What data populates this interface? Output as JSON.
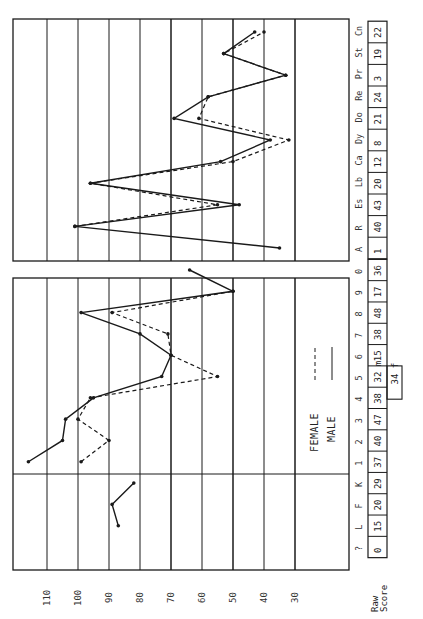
{
  "chart_data": {
    "type": "line",
    "title": "",
    "orientation": "rotated 90deg counter-clockwise (T-score axis horizontal, scales listed vertically)",
    "xlabel": "T-score",
    "ylabel": "Scale",
    "tscore_ticks": [
      110,
      100,
      90,
      80,
      70,
      60,
      50,
      40,
      30
    ],
    "tscore_range": [
      121,
      13
    ],
    "grid": true,
    "raw_score_label": [
      "Raw",
      "Score"
    ],
    "legend": [
      {
        "name": "Female",
        "style": "dashed"
      },
      {
        "name": "Male",
        "style": "solid"
      }
    ],
    "panels": [
      {
        "name": "clinical",
        "categories": [
          "?",
          "L",
          "F",
          "K",
          "1",
          "2",
          "3",
          "4",
          "5",
          "6",
          "7",
          "8",
          "9",
          "0"
        ],
        "raw_scores": [
          "0",
          "15",
          "20",
          "29",
          "37",
          "40",
          "47",
          "38",
          "32 m",
          "15",
          "38",
          "48",
          "17",
          "36"
        ],
        "extra_raw_scores": [
          {
            "category": "5",
            "value": "34 f"
          }
        ],
        "series": [
          {
            "name": "Male",
            "style": "solid",
            "values": [
              null,
              87,
              89,
              82,
              116,
              105,
              104,
              95,
              73,
              70,
              80,
              99,
              50,
              64
            ]
          },
          {
            "name": "Female",
            "style": "dashed",
            "values": [
              null,
              null,
              null,
              null,
              99,
              90,
              100,
              96,
              55,
              70,
              71,
              89,
              50,
              null
            ]
          }
        ]
      },
      {
        "name": "research",
        "categories": [
          "A",
          "R",
          "Es",
          "Lb",
          "Ca",
          "Dy",
          "Do",
          "Re",
          "Pr",
          "St",
          "Cn"
        ],
        "raw_scores": [
          "1",
          "40",
          "43",
          "20",
          "12",
          "8",
          "21",
          "24",
          "3",
          "19",
          "22"
        ],
        "series": [
          {
            "name": "Male",
            "style": "solid",
            "values": [
              35,
              101,
              48,
              96,
              54,
              38,
              69,
              58,
              33,
              53,
              43
            ]
          },
          {
            "name": "Female",
            "style": "dashed",
            "values": [
              null,
              101,
              55,
              96,
              50,
              32,
              61,
              58,
              33,
              53,
              40
            ]
          }
        ]
      }
    ]
  },
  "labels": {
    "legend_female": "FEMALE",
    "legend_male": "MALE",
    "raw_line1": "Raw",
    "raw_line2": "Score"
  },
  "colors": {
    "ink": "#1a1a1a",
    "paper": "#ffffff"
  }
}
